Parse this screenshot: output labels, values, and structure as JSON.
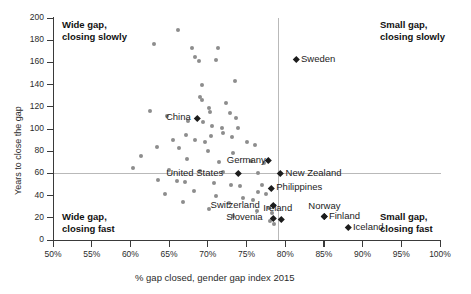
{
  "chart_data": {
    "type": "scatter",
    "title": "",
    "xlabel": "% gap closed, gender gap index 2015",
    "ylabel": "Years to close the gap",
    "xlim": [
      50,
      100
    ],
    "ylim": [
      0,
      200
    ],
    "xticks": [
      "50%",
      "55%",
      "60%",
      "65%",
      "70%",
      "75%",
      "80%",
      "85%",
      "90%",
      "95%",
      "100%"
    ],
    "yticks": [
      "0",
      "20",
      "40",
      "60",
      "80",
      "100",
      "120",
      "140",
      "160",
      "180",
      "200"
    ],
    "grid": "reference lines at y=60 years and x=79%",
    "legend": "none",
    "annotations": [
      {
        "text": "Wide gap,\nclosing slowly",
        "quadrant": "top-left"
      },
      {
        "text": "Small gap,\nclosing slowly",
        "quadrant": "top-right"
      },
      {
        "text": "Wide gap,\nclosing fast",
        "quadrant": "bottom-left"
      },
      {
        "text": "Small gap,\nclosing fast",
        "quadrant": "bottom-right"
      }
    ],
    "reference_lines": {
      "horizontal_y": 60,
      "vertical_x": 79
    },
    "labeled_points": [
      {
        "name": "China",
        "x": 68.6,
        "y": 110,
        "label_side": "left"
      },
      {
        "name": "Sweden",
        "x": 81.4,
        "y": 163,
        "label_side": "right"
      },
      {
        "name": "Germany",
        "x": 77.8,
        "y": 72,
        "label_side": "left"
      },
      {
        "name": "United States",
        "x": 74.0,
        "y": 60,
        "label_side": "left"
      },
      {
        "name": "New Zealand",
        "x": 79.4,
        "y": 60,
        "label_side": "right"
      },
      {
        "name": "Philippines",
        "x": 78.2,
        "y": 47,
        "label_side": "right"
      },
      {
        "name": "Switzerland",
        "x": 78.4,
        "y": 31,
        "label_side": "left"
      },
      {
        "name": "Slovenia",
        "x": 78.4,
        "y": 20,
        "label_side": "left"
      },
      {
        "name": "Ireland",
        "x": 79.5,
        "y": 19,
        "label_side": "above"
      },
      {
        "name": "Norway",
        "x": 85.0,
        "y": 21,
        "label_side": "above"
      },
      {
        "name": "Finland",
        "x": 85.0,
        "y": 21,
        "label_side": "right"
      },
      {
        "name": "Iceland",
        "x": 88.1,
        "y": 11,
        "label_side": "right"
      }
    ],
    "unlabeled_points": [
      {
        "x": 66.2,
        "y": 189
      },
      {
        "x": 63.0,
        "y": 177
      },
      {
        "x": 68.0,
        "y": 173
      },
      {
        "x": 71.3,
        "y": 173
      },
      {
        "x": 68.4,
        "y": 165
      },
      {
        "x": 68.9,
        "y": 161
      },
      {
        "x": 71.1,
        "y": 162
      },
      {
        "x": 73.5,
        "y": 143
      },
      {
        "x": 69.3,
        "y": 140
      },
      {
        "x": 69.0,
        "y": 129
      },
      {
        "x": 69.2,
        "y": 126
      },
      {
        "x": 72.3,
        "y": 123
      },
      {
        "x": 70.2,
        "y": 119
      },
      {
        "x": 70.3,
        "y": 115
      },
      {
        "x": 72.9,
        "y": 114
      },
      {
        "x": 62.5,
        "y": 116
      },
      {
        "x": 64.7,
        "y": 112
      },
      {
        "x": 73.6,
        "y": 110
      },
      {
        "x": 67.5,
        "y": 107
      },
      {
        "x": 69.4,
        "y": 106
      },
      {
        "x": 70.6,
        "y": 103
      },
      {
        "x": 71.8,
        "y": 101
      },
      {
        "x": 73.9,
        "y": 101
      },
      {
        "x": 67.2,
        "y": 95
      },
      {
        "x": 70.4,
        "y": 94
      },
      {
        "x": 71.9,
        "y": 96
      },
      {
        "x": 73.1,
        "y": 93
      },
      {
        "x": 65.5,
        "y": 90
      },
      {
        "x": 68.4,
        "y": 90
      },
      {
        "x": 69.6,
        "y": 88
      },
      {
        "x": 75.0,
        "y": 88
      },
      {
        "x": 76.1,
        "y": 86
      },
      {
        "x": 63.4,
        "y": 84
      },
      {
        "x": 66.3,
        "y": 83
      },
      {
        "x": 70.0,
        "y": 80
      },
      {
        "x": 73.2,
        "y": 78
      },
      {
        "x": 61.4,
        "y": 76
      },
      {
        "x": 67.3,
        "y": 73
      },
      {
        "x": 71.5,
        "y": 70
      },
      {
        "x": 75.6,
        "y": 71
      },
      {
        "x": 77.2,
        "y": 69
      },
      {
        "x": 60.3,
        "y": 65
      },
      {
        "x": 65.0,
        "y": 63
      },
      {
        "x": 69.0,
        "y": 62
      },
      {
        "x": 72.0,
        "y": 61
      },
      {
        "x": 76.5,
        "y": 60
      },
      {
        "x": 63.6,
        "y": 54
      },
      {
        "x": 66.0,
        "y": 53
      },
      {
        "x": 67.0,
        "y": 52
      },
      {
        "x": 70.8,
        "y": 51
      },
      {
        "x": 73.0,
        "y": 50
      },
      {
        "x": 74.1,
        "y": 49
      },
      {
        "x": 77.0,
        "y": 50
      },
      {
        "x": 68.2,
        "y": 44
      },
      {
        "x": 64.5,
        "y": 41
      },
      {
        "x": 71.0,
        "y": 40
      },
      {
        "x": 76.5,
        "y": 43
      },
      {
        "x": 77.5,
        "y": 41
      },
      {
        "x": 74.6,
        "y": 38
      },
      {
        "x": 75.8,
        "y": 36
      },
      {
        "x": 66.8,
        "y": 34
      },
      {
        "x": 72.8,
        "y": 33
      },
      {
        "x": 77.9,
        "y": 29
      },
      {
        "x": 70.2,
        "y": 28
      },
      {
        "x": 76.3,
        "y": 26
      },
      {
        "x": 78.3,
        "y": 24
      },
      {
        "x": 73.3,
        "y": 22
      },
      {
        "x": 78.0,
        "y": 17
      },
      {
        "x": 78.6,
        "y": 14
      }
    ]
  }
}
